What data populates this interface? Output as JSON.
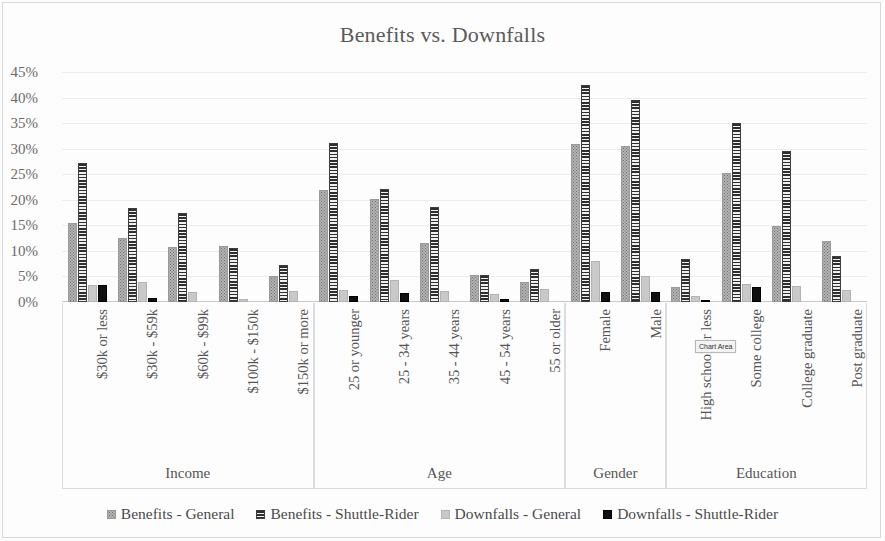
{
  "chart_data": {
    "type": "bar",
    "title": "Benefits vs. Downfalls",
    "xlabel": "",
    "ylabel": "",
    "ylim": [
      0,
      45
    ],
    "ytick_labels": [
      "0%",
      "5%",
      "10%",
      "15%",
      "20%",
      "25%",
      "30%",
      "35%",
      "40%",
      "45%"
    ],
    "ytick_values": [
      0,
      5,
      10,
      15,
      20,
      25,
      30,
      35,
      40,
      45
    ],
    "grid": true,
    "legend_position": "bottom",
    "series": [
      {
        "name": "Benefits - General",
        "key": "s-bg",
        "color": "#b4b4b4",
        "values": [
          15.5,
          12.5,
          10.8,
          11.0,
          5.0,
          22.0,
          20.2,
          11.5,
          5.2,
          4.0,
          31.0,
          30.5,
          3.0,
          25.3,
          14.8,
          12.0
        ]
      },
      {
        "name": "Benefits - Shuttle-Rider",
        "key": "s-bs",
        "color": "#2e2e2e",
        "values": [
          27.2,
          18.3,
          17.5,
          10.5,
          7.3,
          31.2,
          22.2,
          18.5,
          5.3,
          6.5,
          42.5,
          39.5,
          8.5,
          35.0,
          29.5,
          9.0
        ]
      },
      {
        "name": "Downfalls - General",
        "key": "s-dg",
        "color": "#c9c9c9",
        "values": [
          3.3,
          4.0,
          2.0,
          0.6,
          2.2,
          2.3,
          4.3,
          2.2,
          1.6,
          2.5,
          8.0,
          5.0,
          1.2,
          3.6,
          3.2,
          2.4
        ]
      },
      {
        "name": "Downfalls - Shuttle-Rider",
        "key": "s-ds",
        "color": "#101010",
        "values": [
          3.4,
          0.8,
          0.0,
          0.0,
          0.0,
          1.2,
          1.8,
          0.0,
          0.5,
          0.0,
          1.9,
          1.9,
          0.4,
          2.9,
          0.0,
          0.0
        ]
      }
    ],
    "groups": [
      {
        "label": "Income",
        "categories": [
          "$30k or less",
          "$30k - $59k",
          "$60k - $99k",
          "$100k - $150k",
          "$150k or more"
        ]
      },
      {
        "label": "Age",
        "categories": [
          "25 or younger",
          "25 - 34 years",
          "35 - 44 years",
          "45 - 54 years",
          "55 or older"
        ]
      },
      {
        "label": "Gender",
        "categories": [
          "Female",
          "Male"
        ]
      },
      {
        "label": "Education",
        "categories": [
          "High school or less",
          "Some college",
          "College graduate",
          "Post graduate"
        ]
      }
    ]
  },
  "tooltip": {
    "text": "Chart Area"
  }
}
